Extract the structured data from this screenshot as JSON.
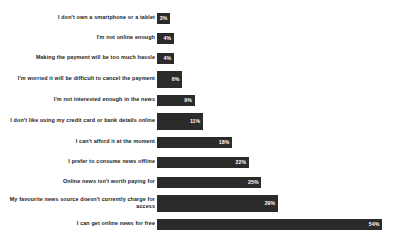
{
  "chart_data": {
    "type": "bar",
    "orientation": "horizontal",
    "title": "",
    "subtitle": "",
    "xlabel": "",
    "ylabel": "",
    "xlim": [
      0,
      54
    ],
    "grid": false,
    "legend": null,
    "value_suffix": "%",
    "bar_color": "#2b2b2b",
    "label_color": "#1a1a1a",
    "value_label_color": "#ffffff",
    "categories": [
      "I don't own a smartphone or a tablet",
      "I'm not online enough",
      "Making the payment will be too much hassle",
      "I'm worried it will be difficult to cancel the payment",
      "I'm not interested enough in the news",
      "I don't like using my credit card or bank details online",
      "I can't afford it at the moment",
      "I prefer to consume news offline",
      "Online news isn't worth paying for",
      "My favourite news source doesn't currently charge for access",
      "I can get online news for free"
    ],
    "values": [
      3,
      4,
      4,
      6,
      9,
      11,
      18,
      22,
      25,
      29,
      54
    ],
    "value_labels": [
      "3%",
      "4%",
      "4%",
      "6%",
      "9%",
      "11%",
      "18%",
      "22%",
      "25%",
      "29%",
      "54%"
    ]
  },
  "rows": [
    {
      "label": "I don't own a smartphone or a tablet",
      "value": 3,
      "value_label": "3%",
      "two_line": false
    },
    {
      "label": "I'm not online enough",
      "value": 4,
      "value_label": "4%",
      "two_line": false
    },
    {
      "label": "Making the payment will be too much hassle",
      "value": 4,
      "value_label": "4%",
      "two_line": false
    },
    {
      "label": "I'm worried it will be difficult to cancel the payment",
      "value": 6,
      "value_label": "6%",
      "two_line": true
    },
    {
      "label": "I'm not interested enough in the news",
      "value": 9,
      "value_label": "9%",
      "two_line": false
    },
    {
      "label": "I don't like using my credit card or bank details online",
      "value": 11,
      "value_label": "11%",
      "two_line": true
    },
    {
      "label": "I can't afford it at the moment",
      "value": 18,
      "value_label": "18%",
      "two_line": false
    },
    {
      "label": "I prefer to consume news offline",
      "value": 22,
      "value_label": "22%",
      "two_line": false
    },
    {
      "label": "Online news isn't worth paying for",
      "value": 25,
      "value_label": "25%",
      "two_line": false
    },
    {
      "label": "My favourite news source doesn't currently charge for access",
      "value": 29,
      "value_label": "29%",
      "two_line": true
    },
    {
      "label": "I can get online news for free",
      "value": 54,
      "value_label": "54%",
      "two_line": false
    }
  ]
}
